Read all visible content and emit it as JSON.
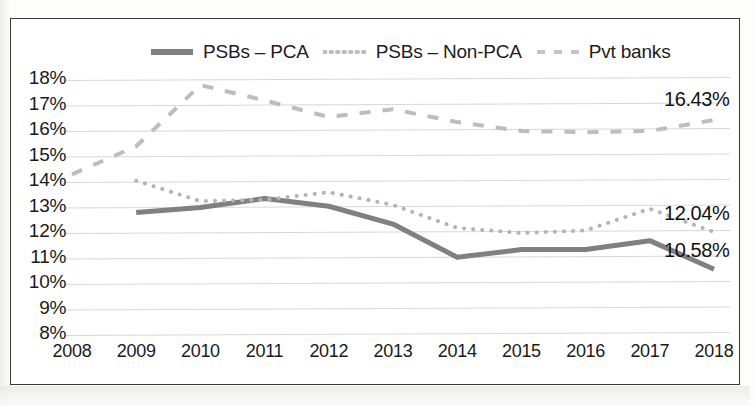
{
  "chart_data": {
    "type": "line",
    "title": "",
    "xlabel": "",
    "ylabel": "",
    "x": [
      2008,
      2009,
      2010,
      2011,
      2012,
      2013,
      2014,
      2015,
      2016,
      2017,
      2018
    ],
    "categories": [
      "2008",
      "2009",
      "2010",
      "2011",
      "2012",
      "2013",
      "2014",
      "2015",
      "2016",
      "2017",
      "2018"
    ],
    "ylim": [
      8,
      18
    ],
    "ytick_labels": [
      "18%",
      "17%",
      "16%",
      "15%",
      "14%",
      "13%",
      "12%",
      "11%",
      "10%",
      "9%",
      "8%"
    ],
    "ytick_values": [
      18,
      17,
      16,
      15,
      14,
      13,
      12,
      11,
      10,
      9,
      8
    ],
    "grid": true,
    "legend_position": "top-center",
    "series": [
      {
        "name": "PSBs – PCA",
        "style": "solid",
        "color": "#808080",
        "width": 5,
        "x": [
          2009,
          2010,
          2011,
          2012,
          2013,
          2014,
          2015,
          2016,
          2017,
          2018
        ],
        "values": [
          12.8,
          13.0,
          13.35,
          13.05,
          12.35,
          11.05,
          11.35,
          11.35,
          11.7,
          10.58
        ],
        "end_label": "10.58%"
      },
      {
        "name": "PSBs – Non-PCA",
        "style": "dotted",
        "color": "#b4b4b4",
        "width": 4,
        "x": [
          2009,
          2010,
          2011,
          2012,
          2013,
          2014,
          2015,
          2016,
          2017,
          2018
        ],
        "values": [
          14.05,
          13.25,
          13.3,
          13.6,
          13.1,
          12.2,
          12.0,
          12.1,
          12.95,
          12.04
        ],
        "end_label": "12.04%"
      },
      {
        "name": "Pvt banks",
        "style": "dashed",
        "color": "#bdbdbd",
        "width": 4,
        "x": [
          2008,
          2009,
          2010,
          2011,
          2012,
          2013,
          2014,
          2015,
          2016,
          2017,
          2018
        ],
        "values": [
          14.3,
          15.4,
          17.8,
          17.2,
          16.55,
          16.85,
          16.35,
          16.0,
          15.95,
          16.0,
          16.43
        ],
        "end_label": "16.43%"
      }
    ],
    "end_labels": [
      "16.43%",
      "12.04%",
      "10.58%"
    ]
  },
  "legend": {
    "items": [
      {
        "label": "PSBs – PCA",
        "style": "solid",
        "color": "#808080"
      },
      {
        "label": "PSBs – Non-PCA",
        "style": "dotted",
        "color": "#b8b8b8"
      },
      {
        "label": "Pvt banks",
        "style": "dashed",
        "color": "#c0c0c0"
      }
    ]
  },
  "colors": {
    "frame": "#3a3a3a",
    "grid": "#d8d8d8",
    "text": "#1a1a1a",
    "background": "#ffffff"
  }
}
